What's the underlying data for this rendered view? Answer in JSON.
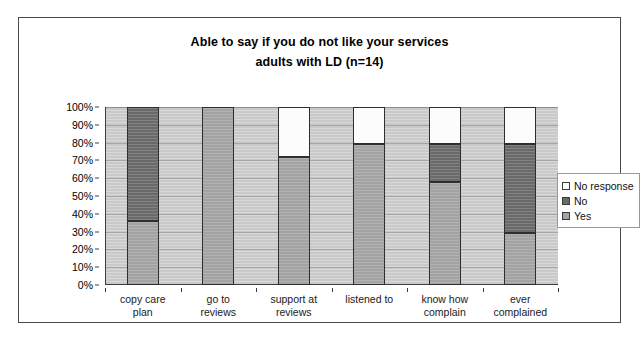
{
  "chart_data": {
    "type": "bar",
    "subtype": "100% stacked column",
    "title": "Able to say if you do not like your services",
    "subtitle": "adults with LD (n=14)",
    "xlabel": "",
    "ylabel": "",
    "ylim": [
      0,
      100
    ],
    "ytick_labels": [
      "100%",
      "90%",
      "80%",
      "70%",
      "60%",
      "50%",
      "40%",
      "30%",
      "20%",
      "10%",
      "0%"
    ],
    "ytick_values": [
      100,
      90,
      80,
      70,
      60,
      50,
      40,
      30,
      20,
      10,
      0
    ],
    "grid": true,
    "grid_orientation": "horizontal",
    "legend_position": "right",
    "categories": [
      "copy care plan",
      "go to reviews",
      "support at reviews",
      "listened to",
      "know how complain",
      "ever complained"
    ],
    "category_lines": [
      [
        "copy care",
        "plan"
      ],
      [
        "go to",
        "reviews"
      ],
      [
        "support at",
        "reviews"
      ],
      [
        "listened to",
        ""
      ],
      [
        "know how",
        "complain"
      ],
      [
        "ever",
        "complained"
      ]
    ],
    "series": [
      {
        "name": "Yes",
        "color": "#a3a3a3",
        "values": [
          36,
          100,
          72,
          79,
          58,
          29
        ]
      },
      {
        "name": "No",
        "color": "#6a6a6a",
        "values": [
          64,
          0,
          0,
          0,
          21,
          50
        ]
      },
      {
        "name": "No response",
        "color": "#fcfcfc",
        "values": [
          0,
          0,
          28,
          21,
          21,
          21
        ]
      }
    ],
    "legend_entries": [
      {
        "label": "No response",
        "color": "#fcfcfc"
      },
      {
        "label": "No",
        "color": "#6a6a6a"
      },
      {
        "label": "Yes",
        "color": "#a3a3a3"
      }
    ],
    "colors": {
      "plot_background": "#c9c9c9",
      "page_background": "#ffffff",
      "axis": "#3d3d3d",
      "gridline": "#a4a4a4",
      "text": "#000000"
    }
  }
}
